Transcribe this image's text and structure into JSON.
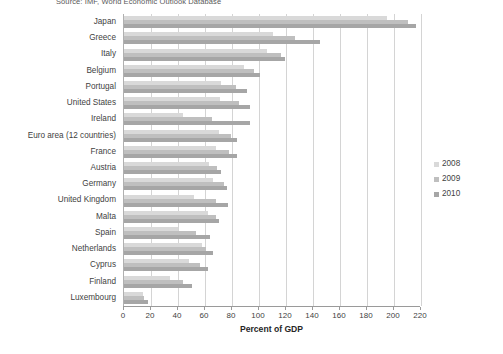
{
  "source_note": "Source: IMF, World Economic Outlook Database",
  "chart_data": {
    "type": "bar",
    "orientation": "horizontal",
    "title": "",
    "xlabel": "Percent of GDP",
    "ylabel": "",
    "xlim": [
      0,
      220
    ],
    "xticks": [
      0,
      20,
      40,
      60,
      80,
      100,
      120,
      140,
      160,
      180,
      200,
      220
    ],
    "grid": true,
    "legend_position": "right",
    "categories": [
      "Japan",
      "Greece",
      "Italy",
      "Belgium",
      "Portugal",
      "United States",
      "Ireland",
      "Euro area (12 countries)",
      "France",
      "Austria",
      "Germany",
      "United Kingdom",
      "Malta",
      "Spain",
      "Netherlands",
      "Cyprus",
      "Finland",
      "Luxembourg"
    ],
    "series": [
      {
        "name": "2008",
        "color": "#d9d9d9",
        "values": [
          195,
          110,
          106,
          89,
          72,
          71,
          44,
          70,
          68,
          63,
          66,
          52,
          62,
          40,
          58,
          48,
          34,
          14
        ]
      },
      {
        "name": "2009",
        "color": "#bfbfbf",
        "values": [
          210,
          127,
          116,
          96,
          83,
          85,
          65,
          79,
          78,
          69,
          74,
          68,
          68,
          53,
          61,
          56,
          44,
          15
        ]
      },
      {
        "name": "2010",
        "color": "#a6a6a6",
        "values": [
          216,
          145,
          119,
          101,
          91,
          93,
          93,
          84,
          84,
          72,
          76,
          77,
          70,
          64,
          66,
          62,
          50,
          18
        ]
      }
    ]
  },
  "legend": {
    "items": [
      {
        "label": "2008"
      },
      {
        "label": "2009"
      },
      {
        "label": "2010"
      }
    ]
  }
}
